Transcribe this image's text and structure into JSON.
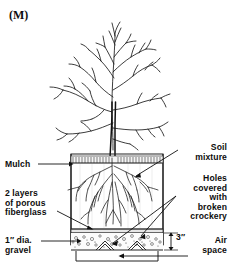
{
  "figure": {
    "panel_tag": "(M)",
    "ink_color": "#111111",
    "background_color": "#ffffff"
  },
  "labels": {
    "mulch": "Mulch",
    "fiberglass": "2 layers\nof porous\nfiberglass",
    "gravel": "1″ dia.\ngravel",
    "soil_mixture": "Soil\nmixture",
    "holes": "Holes\ncovered\nwith\nbroken\ncrockery",
    "air_space": "Air\nspace",
    "dimension_depth": "3″"
  },
  "parts": {
    "tree": "bare-deciduous-tree",
    "trunk": "trunk",
    "roots": "root-system",
    "container": "planting-container",
    "mulch_layer": "mulch-hatched-band",
    "soil_layer": "soil-mixture-fill",
    "fiberglass_layer": "porous-fiberglass-sheet",
    "gravel_layer": "gravel-bed",
    "crockery": "broken-crockery-over-holes",
    "air_gap": "air-space-bracket"
  }
}
